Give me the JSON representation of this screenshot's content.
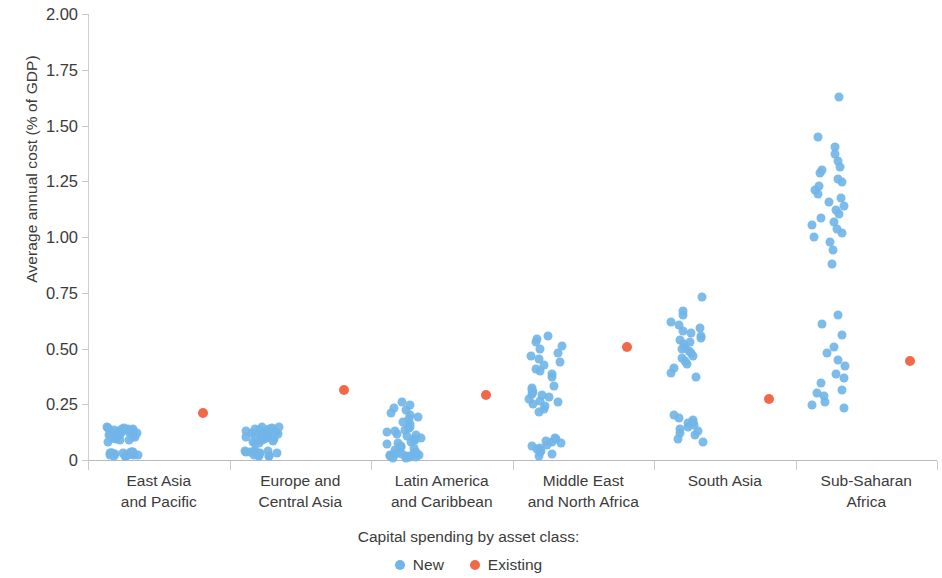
{
  "chart_data": {
    "type": "scatter",
    "title": "",
    "subtitle": "",
    "xlabel": "",
    "ylabel": "Average annual cost (% of GDP)",
    "ylim": [
      0,
      2.0
    ],
    "yticks": [
      0,
      0.25,
      0.5,
      0.75,
      1.0,
      1.25,
      1.5,
      1.75,
      2.0
    ],
    "ytick_labels": [
      "0",
      "0.25",
      "0.50",
      "0.75",
      "1.00",
      "1.25",
      "1.50",
      "1.75",
      "2.00"
    ],
    "grid": false,
    "legend_position": "bottom",
    "legend_title": "Capital spending by asset class:",
    "categories": [
      "East Asia and Pacific",
      "Europe and Central Asia",
      "Latin America and Caribbean",
      "Middle East and North Africa",
      "South Asia",
      "Sub-Saharan Africa"
    ],
    "category_lines": [
      [
        "East Asia",
        "and Pacific"
      ],
      [
        "Europe and",
        "Central Asia"
      ],
      [
        "Latin America",
        "and Caribbean"
      ],
      [
        "Middle East",
        "and North Africa"
      ],
      [
        "South Asia"
      ],
      [
        "Sub-Saharan",
        "Africa"
      ]
    ],
    "series": [
      {
        "name": "New",
        "color": "#71b5e8",
        "marker": "circle",
        "groups": [
          {
            "category": "East Asia and Pacific",
            "values": [
              0.016,
              0.018,
              0.019,
              0.021,
              0.022,
              0.023,
              0.024,
              0.024,
              0.025,
              0.026,
              0.027,
              0.028,
              0.029,
              0.03,
              0.031,
              0.032,
              0.033,
              0.034,
              0.035,
              0.036,
              0.082,
              0.088,
              0.091,
              0.094,
              0.097,
              0.099,
              0.101,
              0.104,
              0.106,
              0.108,
              0.11,
              0.112,
              0.114,
              0.116,
              0.118,
              0.12,
              0.121,
              0.123,
              0.125,
              0.127,
              0.129,
              0.131,
              0.133,
              0.135,
              0.137,
              0.139,
              0.141,
              0.143,
              0.145,
              0.148
            ]
          },
          {
            "category": "Europe and Central Asia",
            "values": [
              0.016,
              0.018,
              0.02,
              0.022,
              0.024,
              0.026,
              0.028,
              0.03,
              0.032,
              0.034,
              0.036,
              0.038,
              0.04,
              0.042,
              0.044,
              0.074,
              0.078,
              0.082,
              0.086,
              0.09,
              0.093,
              0.096,
              0.099,
              0.102,
              0.104,
              0.106,
              0.108,
              0.11,
              0.112,
              0.114,
              0.116,
              0.118,
              0.12,
              0.122,
              0.124,
              0.126,
              0.128,
              0.13,
              0.132,
              0.134,
              0.136,
              0.138,
              0.141,
              0.144,
              0.147,
              0.15
            ]
          },
          {
            "category": "Latin America and Caribbean",
            "values": [
              0.008,
              0.01,
              0.012,
              0.014,
              0.016,
              0.018,
              0.02,
              0.022,
              0.024,
              0.026,
              0.028,
              0.03,
              0.032,
              0.034,
              0.046,
              0.052,
              0.058,
              0.064,
              0.07,
              0.076,
              0.082,
              0.088,
              0.094,
              0.1,
              0.106,
              0.112,
              0.118,
              0.124,
              0.13,
              0.136,
              0.142,
              0.148,
              0.16,
              0.172,
              0.182,
              0.192,
              0.202,
              0.212,
              0.222,
              0.234,
              0.248,
              0.262
            ]
          },
          {
            "category": "Middle East and North Africa",
            "values": [
              0.018,
              0.026,
              0.034,
              0.042,
              0.05,
              0.056,
              0.062,
              0.068,
              0.074,
              0.08,
              0.086,
              0.092,
              0.098,
              0.215,
              0.228,
              0.24,
              0.25,
              0.258,
              0.266,
              0.274,
              0.282,
              0.29,
              0.298,
              0.306,
              0.314,
              0.322,
              0.33,
              0.372,
              0.386,
              0.398,
              0.41,
              0.424,
              0.438,
              0.452,
              0.466,
              0.48,
              0.496,
              0.512,
              0.528,
              0.544,
              0.558
            ]
          },
          {
            "category": "South Asia",
            "values": [
              0.082,
              0.096,
              0.11,
              0.122,
              0.132,
              0.14,
              0.148,
              0.156,
              0.164,
              0.172,
              0.18,
              0.19,
              0.2,
              0.372,
              0.392,
              0.412,
              0.43,
              0.444,
              0.456,
              0.468,
              0.478,
              0.488,
              0.498,
              0.508,
              0.518,
              0.528,
              0.538,
              0.548,
              0.558,
              0.568,
              0.58,
              0.592,
              0.604,
              0.62,
              0.65,
              0.666,
              0.73
            ]
          },
          {
            "category": "Sub-Saharan Africa",
            "values": [
              0.232,
              0.248,
              0.262,
              0.288,
              0.3,
              0.316,
              0.346,
              0.366,
              0.386,
              0.42,
              0.448,
              0.478,
              0.508,
              0.56,
              0.612,
              0.652,
              0.878,
              0.942,
              0.978,
              1.0,
              1.018,
              1.036,
              1.052,
              1.068,
              1.086,
              1.102,
              1.12,
              1.138,
              1.156,
              1.174,
              1.192,
              1.21,
              1.228,
              1.246,
              1.262,
              1.286,
              1.3,
              1.316,
              1.34,
              1.372,
              1.402,
              1.448,
              1.63
            ]
          }
        ]
      },
      {
        "name": "Existing",
        "color": "#f2694a",
        "marker": "circle",
        "groups": [
          {
            "category": "East Asia and Pacific",
            "values": [
              0.212
            ]
          },
          {
            "category": "Europe and Central Asia",
            "values": [
              0.312
            ]
          },
          {
            "category": "Latin America and Caribbean",
            "values": [
              0.292
            ]
          },
          {
            "category": "Middle East and North Africa",
            "values": [
              0.508
            ]
          },
          {
            "category": "South Asia",
            "values": [
              0.275
            ]
          },
          {
            "category": "Sub-Saharan Africa",
            "values": [
              0.445
            ]
          }
        ]
      }
    ]
  },
  "legend": {
    "title": "Capital spending by asset class:",
    "items": [
      {
        "label": "New",
        "color": "#71b5e8"
      },
      {
        "label": "Existing",
        "color": "#f2694a"
      }
    ]
  },
  "axes": {
    "y_title": "Average annual cost (% of GDP)",
    "y_tick_labels": [
      "2.00",
      "1.75",
      "1.50",
      "1.25",
      "1.00",
      "0.75",
      "0.50",
      "0.25",
      "0"
    ]
  }
}
